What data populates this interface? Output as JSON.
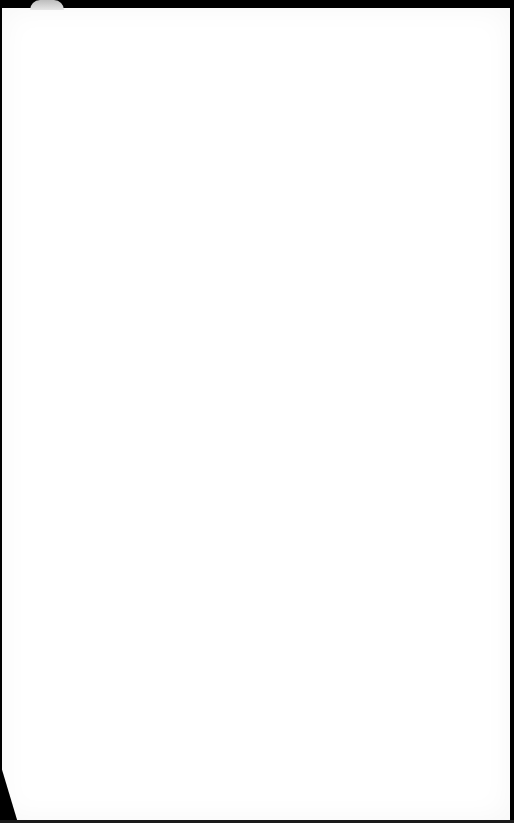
{
  "scene": {
    "description": "blank white sheet of paper on dark background",
    "colors": {
      "background": "#000000",
      "paper": "#ffffff",
      "curl_shadow": "#bdbdbd"
    }
  }
}
